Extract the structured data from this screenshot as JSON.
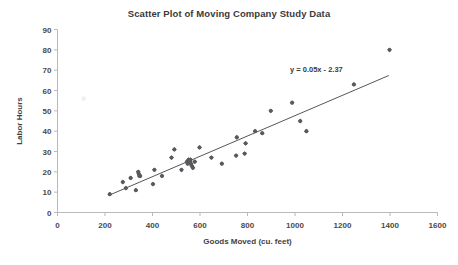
{
  "chart_data": {
    "type": "scatter",
    "title": "Scatter Plot of Moving Company Study Data",
    "xlabel": "Goods Moved (cu. feet)",
    "ylabel": "Labor Hours",
    "xlim": [
      0,
      1600
    ],
    "ylim": [
      0,
      90
    ],
    "xticks": [
      0,
      200,
      400,
      600,
      800,
      1000,
      1200,
      1400,
      1600
    ],
    "yticks": [
      0,
      10,
      20,
      30,
      40,
      50,
      60,
      70,
      80,
      90
    ],
    "grid": false,
    "legend": "none",
    "marker_color": "#5a5a5e",
    "trendline_color": "#55565a",
    "annotations": [
      {
        "name": "regression-equation",
        "text": "y = 0.05x - 2.37",
        "x": 1090,
        "y": 69
      }
    ],
    "trendline": {
      "slope": 0.05,
      "intercept": -2.37,
      "x_start": 218,
      "x_end": 1395
    },
    "series": [
      {
        "name": "Moving Company Study Data",
        "points": [
          [
            220,
            9
          ],
          [
            275,
            15
          ],
          [
            288,
            12
          ],
          [
            308,
            17
          ],
          [
            330,
            11
          ],
          [
            340,
            20
          ],
          [
            342,
            19
          ],
          [
            345,
            18
          ],
          [
            348,
            18
          ],
          [
            402,
            14
          ],
          [
            408,
            21
          ],
          [
            440,
            18
          ],
          [
            480,
            27
          ],
          [
            492,
            31
          ],
          [
            522,
            21
          ],
          [
            545,
            25
          ],
          [
            548,
            24
          ],
          [
            552,
            26
          ],
          [
            558,
            25
          ],
          [
            560,
            26
          ],
          [
            562,
            24
          ],
          [
            565,
            23
          ],
          [
            570,
            22
          ],
          [
            578,
            25
          ],
          [
            598,
            32
          ],
          [
            648,
            27
          ],
          [
            692,
            24
          ],
          [
            752,
            28
          ],
          [
            755,
            37
          ],
          [
            788,
            29
          ],
          [
            792,
            34
          ],
          [
            832,
            40
          ],
          [
            862,
            39
          ],
          [
            898,
            50
          ],
          [
            988,
            54
          ],
          [
            1022,
            45
          ],
          [
            1048,
            40
          ],
          [
            1248,
            63
          ],
          [
            1398,
            80
          ]
        ]
      }
    ],
    "artifacts": [
      {
        "name": "scan-speck",
        "x": 110,
        "y": 56
      }
    ]
  }
}
